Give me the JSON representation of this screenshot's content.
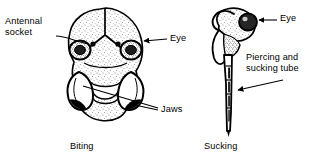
{
  "figure": {
    "background_color": "#ffffff",
    "ink_color": "#000000",
    "width": 320,
    "height": 168
  },
  "panels": [
    {
      "id": "biting",
      "caption": "Biting",
      "subject": "frontal view of a biting insect head with mandibles",
      "labels": [
        {
          "id": "antennal-socket",
          "text": "Antennal\nsocket"
        },
        {
          "id": "eye-left",
          "text": "Eye"
        },
        {
          "id": "jaws",
          "text": "Jaws"
        }
      ]
    },
    {
      "id": "sucking",
      "caption": "Sucking",
      "subject": "lateral view of a sucking insect head with elongated proboscis",
      "labels": [
        {
          "id": "eye-right",
          "text": "Eye"
        },
        {
          "id": "piercing-sucking-tube",
          "text": "Piercing and\nsucking tube"
        }
      ]
    }
  ],
  "labels": {
    "antennal_socket": "Antennal\nsocket",
    "eye_left": "Eye",
    "jaws": "Jaws",
    "eye_right": "Eye",
    "piercing_sucking_tube": "Piercing and\nsucking tube",
    "caption_biting": "Biting",
    "caption_sucking": "Sucking"
  }
}
